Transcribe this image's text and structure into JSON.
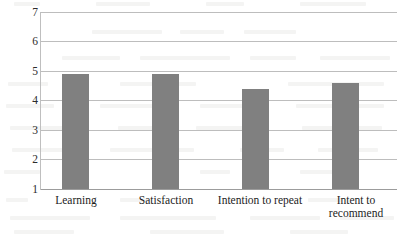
{
  "chart_data": {
    "type": "bar",
    "title": "",
    "subtitle": "",
    "xlabel": "",
    "ylabel": "",
    "categories": [
      "Learning",
      "Satisfaction",
      "Intention to repeat",
      "Intent to recommend"
    ],
    "values": [
      4.9,
      4.9,
      4.4,
      4.6
    ],
    "ylim": [
      1,
      7
    ],
    "yticks": [
      1,
      2,
      3,
      4,
      5,
      6,
      7
    ],
    "ytick_labels": [
      "1",
      "2",
      "3",
      "4",
      "5",
      "6",
      "7"
    ],
    "grid": true,
    "grid_axis": "y",
    "legend": false,
    "legend_position": "none",
    "series": [
      {
        "name": "",
        "values": [
          4.9,
          4.9,
          4.4,
          4.6
        ]
      }
    ]
  },
  "style": {
    "bar_color": "#808080",
    "grid_color": "#bdbdbd",
    "axis_color": "#9c9c9c",
    "text_color": "#1c1c1c",
    "background": "#ffffff"
  },
  "category_label_lines": [
    [
      "Learning"
    ],
    [
      "Satisfaction"
    ],
    [
      "Intention to repeat"
    ],
    [
      "Intent to",
      "recommend"
    ]
  ]
}
